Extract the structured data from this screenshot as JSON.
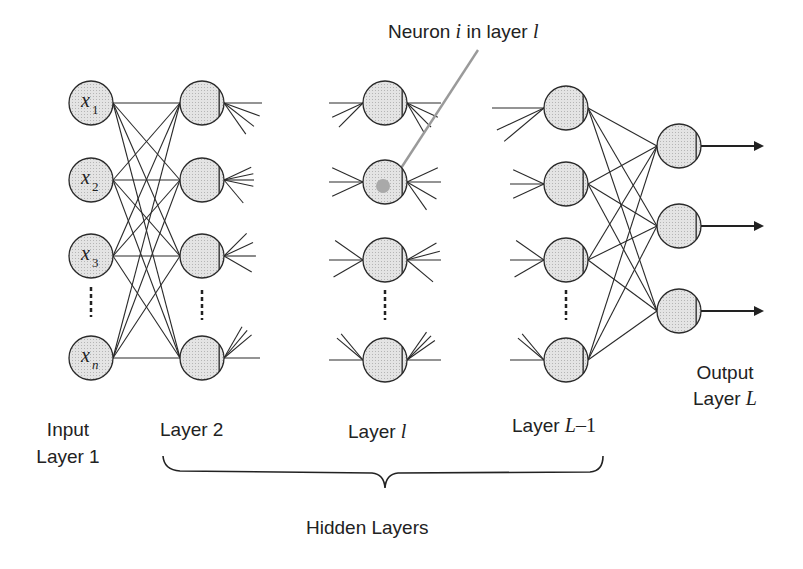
{
  "title_annotation": {
    "prefix": "Neuron ",
    "i": "i",
    "middle": " in layer ",
    "l": "l"
  },
  "inputs": [
    {
      "sym": "x",
      "sub": "1"
    },
    {
      "sym": "x",
      "sub": "2"
    },
    {
      "sym": "x",
      "sub": "3"
    },
    {
      "sym": "x",
      "sub": "n"
    }
  ],
  "labels": {
    "input": {
      "line1": "Input",
      "line2": "Layer 1"
    },
    "layer2": "Layer 2",
    "layer_l": {
      "text": "Layer ",
      "var": "l"
    },
    "layer_L1": {
      "text": "Layer ",
      "var": "L",
      "suffix": "–1"
    },
    "output": {
      "line1": "Output",
      "line2_text": "Layer ",
      "line2_var": "L"
    },
    "hidden": "Hidden Layers"
  },
  "colors": {
    "neuron_fill": "#dcdcdc",
    "stroke": "#2a2a2a",
    "highlight": "#a9a9a9",
    "pointer": "#9a9a9a"
  },
  "layout": {
    "radius": 22,
    "layers": [
      {
        "name": "input",
        "x": 91,
        "ys": [
          103,
          180,
          256,
          358
        ]
      },
      {
        "name": "layer2",
        "x": 202,
        "ys": [
          103,
          180,
          256,
          358
        ]
      },
      {
        "name": "layer_l",
        "x": 385,
        "ys": [
          103,
          182,
          260,
          360
        ]
      },
      {
        "name": "layer_L1",
        "x": 566,
        "ys": [
          108,
          184,
          260,
          360
        ]
      },
      {
        "name": "output",
        "x": 679,
        "ys": [
          146,
          226,
          311
        ]
      }
    ]
  }
}
